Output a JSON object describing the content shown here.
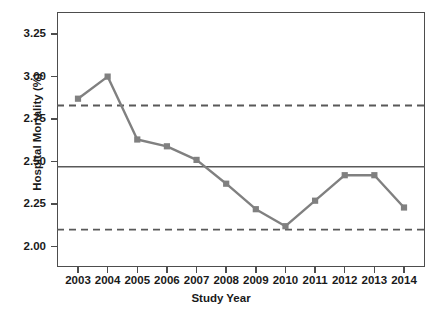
{
  "chart_data": {
    "type": "line",
    "title": "",
    "xlabel": "Study Year",
    "ylabel": "Hospital Mortality (%)",
    "categories": [
      "2003",
      "2004",
      "2005",
      "2006",
      "2007",
      "2008",
      "2009",
      "2010",
      "2011",
      "2012",
      "2013",
      "2014"
    ],
    "values": [
      2.87,
      3.0,
      2.63,
      2.59,
      2.51,
      2.37,
      2.22,
      2.12,
      2.27,
      2.42,
      2.42,
      2.23
    ],
    "series": [
      {
        "name": "Hospital Mortality (%)",
        "values": [
          2.87,
          3.0,
          2.63,
          2.59,
          2.51,
          2.37,
          2.22,
          2.12,
          2.27,
          2.42,
          2.42,
          2.23
        ],
        "color": "#808080",
        "marker": "square",
        "line_style": "solid"
      }
    ],
    "reference_lines": [
      {
        "name": "upper-control-limit",
        "value": 2.83,
        "style": "dashed",
        "color": "#595959"
      },
      {
        "name": "center-line-mean",
        "value": 2.47,
        "style": "solid",
        "color": "#595959"
      },
      {
        "name": "lower-control-limit",
        "value": 2.1,
        "style": "dashed",
        "color": "#595959"
      }
    ],
    "ylim": [
      1.88,
      3.38
    ],
    "yticks": [
      3.25,
      3.0,
      2.75,
      2.5,
      2.25,
      2.0
    ],
    "ytick_labels": [
      "3.25",
      "3.00",
      "2.75",
      "2.50",
      "2.25",
      "2.00"
    ],
    "xtick_labels": [
      "2003",
      "2004",
      "2005",
      "2006",
      "2007",
      "2008",
      "2009",
      "2010",
      "2011",
      "2012",
      "2013",
      "2014"
    ],
    "grid": false,
    "legend": "none",
    "background": "#ffffff",
    "frame_color": "#4d4d4d"
  }
}
